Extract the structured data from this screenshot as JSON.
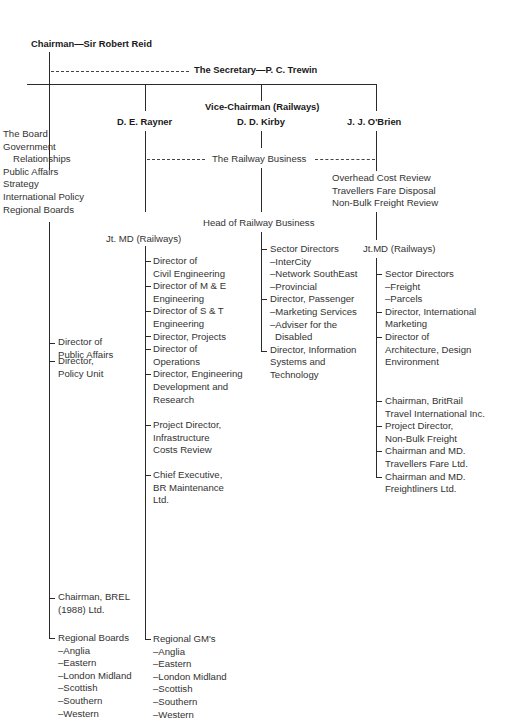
{
  "chairman": {
    "title": "Chairman",
    "name": "Sir Robert Reid",
    "label": "Chairman—Sir Robert Reid"
  },
  "secretary": {
    "title": "The Secretary",
    "name": "P. C. Trewin",
    "label": "The Secretary—P. C. Trewin"
  },
  "chairman_functions": [
    "The Board",
    "Government",
    "Relationships",
    "Public Affairs",
    "Strategy",
    "International Policy",
    "Regional Boards"
  ],
  "chairman_reports": [
    {
      "lines": [
        "Director of",
        "Public Affairs"
      ]
    },
    {
      "lines": [
        "Director,",
        "Policy Unit"
      ]
    },
    {
      "lines": [
        "Chairman, BREL",
        "(1988) Ltd."
      ]
    },
    {
      "lines": [
        "Regional Boards",
        "–Anglia",
        "–Eastern",
        "–London Midland",
        "–Scottish",
        "–Southern",
        "–Western"
      ]
    }
  ],
  "railway_business": "The Railway Business",
  "rayner": {
    "name": "D. E. Rayner",
    "role": "Jt. MD (Railways)",
    "reports": [
      {
        "lines": [
          "Director of",
          "Civil Engineering"
        ]
      },
      {
        "lines": [
          "Director of M & E",
          "Engineering"
        ]
      },
      {
        "lines": [
          "Director of S & T",
          "Engineering"
        ]
      },
      {
        "lines": [
          "Director, Projects"
        ]
      },
      {
        "lines": [
          "Director of",
          "Operations"
        ]
      },
      {
        "lines": [
          "Director, Engineering",
          "Development and",
          "Research"
        ]
      },
      {
        "lines": [
          "Project Director,",
          "Infrastructure",
          "Costs Review"
        ]
      },
      {
        "lines": [
          "Chief Executive,",
          "BR Maintenance",
          "Ltd."
        ]
      },
      {
        "lines": [
          "Regional GM's",
          "–Anglia",
          "–Eastern",
          "–London Midland",
          "–Scottish",
          "–Southern",
          "–Western"
        ]
      }
    ]
  },
  "kirby": {
    "title": "Vice-Chairman (Railways)",
    "name": "D. D. Kirby",
    "role": "Head of Railway Business",
    "reports": [
      {
        "lines": [
          "Sector Directors",
          "–InterCity",
          "–Network SouthEast",
          "–Provincial"
        ]
      },
      {
        "lines": [
          "Director, Passenger",
          "–Marketing Services",
          "–Adviser for the",
          "Disabled"
        ]
      },
      {
        "lines": [
          "Director, Information",
          "Systems and",
          "Technology"
        ]
      }
    ]
  },
  "obrien": {
    "name": "J. J. O'Brien",
    "functions": [
      "Overhead Cost Review",
      "Travellers Fare Disposal",
      "Non-Bulk Freight Review"
    ],
    "role": "Jt.MD (Railways)",
    "reports": [
      {
        "lines": [
          "Sector Directors",
          "–Freight",
          "–Parcels"
        ]
      },
      {
        "lines": [
          "Director, International",
          "Marketing"
        ]
      },
      {
        "lines": [
          "Director of",
          "Architecture, Design",
          "Environment"
        ]
      },
      {
        "lines": [
          "Chairman, BritRail",
          "Travel International Inc."
        ]
      },
      {
        "lines": [
          "Project Director,",
          "Non-Bulk Freight"
        ]
      },
      {
        "lines": [
          "Chairman and MD.",
          "Travellers Fare Ltd."
        ]
      },
      {
        "lines": [
          "Chairman and MD.",
          "Freightliners Ltd."
        ]
      }
    ]
  }
}
